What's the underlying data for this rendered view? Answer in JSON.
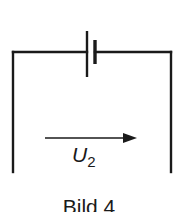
{
  "figure": {
    "caption": "Bild 4",
    "voltage_label": {
      "symbol": "U",
      "subscript": "2"
    },
    "components": [
      {
        "type": "battery",
        "position": "top-center"
      },
      {
        "type": "voltage-arrow",
        "direction": "right",
        "label": "U2"
      }
    ],
    "colors": {
      "line": "#1a1a1a",
      "background": "#ffffff"
    }
  }
}
